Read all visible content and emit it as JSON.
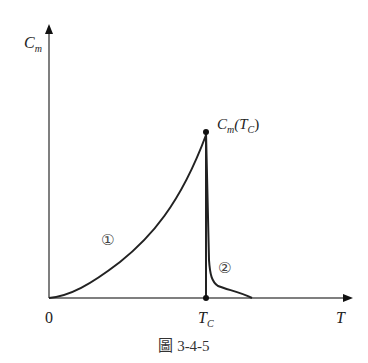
{
  "figure": {
    "caption": "圖 3-4-5",
    "y_axis_label": "C",
    "y_axis_label_sub": "m",
    "x_axis_label": "T",
    "origin_label": "0",
    "tc_label": "T",
    "tc_label_sub": "C",
    "peak_label": "C",
    "peak_label_sub": "m",
    "peak_label_rest_open": "(T",
    "peak_label_rest_sub": "C",
    "peak_label_close": ")",
    "curve1_label": "①",
    "curve2_label": "②",
    "line_color": "#222222",
    "axis_color": "#555555"
  }
}
